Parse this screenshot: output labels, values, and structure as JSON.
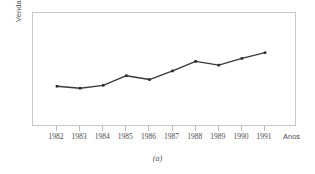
{
  "figure": {
    "caption": "(a)"
  },
  "chart_data": {
    "type": "line",
    "title": "",
    "subtitle": "",
    "xlabel": "Anos",
    "ylabel": "Vendas, x",
    "categories": [
      "1982",
      "1983",
      "1984",
      "1985",
      "1986",
      "1987",
      "1988",
      "1989",
      "1990",
      "1991"
    ],
    "values": [
      32,
      30,
      33,
      43,
      39,
      48,
      58,
      54,
      61,
      67
    ],
    "series": [
      {
        "name": "Vendas",
        "values": [
          32,
          30,
          33,
          43,
          39,
          48,
          58,
          54,
          61,
          67
        ]
      }
    ],
    "ylim": [
      0,
      100
    ],
    "yticks": [],
    "ytick_labels": [],
    "grid": false,
    "legend": false,
    "legend_position": "none",
    "marker": "filled-square",
    "line_color": "#3a3a3f",
    "marker_color": "#2c2c31",
    "frame_color": "#c8c8cc",
    "annotations": []
  }
}
